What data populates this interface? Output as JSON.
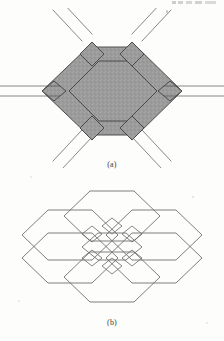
{
  "document": {
    "kind": "scanned-figure-page",
    "background_color": "#fdfdfc",
    "ink_color": "#4a4a4a"
  },
  "figures": [
    {
      "id": "figure-a",
      "caption": "(a)",
      "description": "Shaded hexagonal junction motif with six parallelogram couplers and six pairs of parallel waveguide lines radiating outward",
      "fill_color": "#9c9c9c",
      "stroke_color": "#4f4f4f",
      "outer_hexagon": {
        "center": [
          112,
          94
        ],
        "vertices": [
          [
            88,
            47
          ],
          [
            137,
            47
          ],
          [
            182,
            94
          ],
          [
            137,
            141
          ],
          [
            88,
            141
          ],
          [
            42,
            94
          ]
        ]
      },
      "inner_hexagon": {
        "center": [
          112,
          94
        ],
        "vertices": [
          [
            98,
            61
          ],
          [
            127,
            61
          ],
          [
            157,
            94
          ],
          [
            127,
            127
          ],
          [
            98,
            127
          ],
          [
            68,
            94
          ]
        ]
      },
      "couplers": [
        {
          "name": "coupler-top-left",
          "vertex": [
            88,
            47
          ]
        },
        {
          "name": "coupler-top-right",
          "vertex": [
            137,
            47
          ]
        },
        {
          "name": "coupler-right",
          "vertex": [
            182,
            94
          ]
        },
        {
          "name": "coupler-bottom-right",
          "vertex": [
            137,
            141
          ]
        },
        {
          "name": "coupler-bottom-left",
          "vertex": [
            88,
            141
          ]
        },
        {
          "name": "coupler-left",
          "vertex": [
            42,
            94
          ]
        }
      ],
      "leads": [
        {
          "name": "lead-upper-left",
          "angle_deg": 225
        },
        {
          "name": "lead-upper-right",
          "angle_deg": 315
        },
        {
          "name": "lead-right",
          "angle_deg": 0
        },
        {
          "name": "lead-lower-right",
          "angle_deg": 45
        },
        {
          "name": "lead-lower-left",
          "angle_deg": 135
        },
        {
          "name": "lead-left",
          "angle_deg": 180
        }
      ]
    },
    {
      "id": "figure-b",
      "caption": "(b)",
      "description": "Tiled array of seven overlapping unshaded hexagons forming an extended hexagonal lattice network",
      "fill_color": "none",
      "stroke_color": "#6a6a6a",
      "hexagon_count": 7,
      "hexagon_centers": [
        [
          112,
          248
        ],
        [
          112,
          210
        ],
        [
          112,
          286
        ],
        [
          70,
          229
        ],
        [
          154,
          229
        ],
        [
          70,
          267
        ],
        [
          154,
          267
        ]
      ]
    }
  ],
  "artifacts": {
    "top_edge_smudge": true,
    "specks": 6
  }
}
